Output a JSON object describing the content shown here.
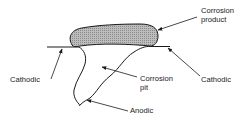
{
  "diagram": {
    "title": "",
    "labels": {
      "corrosion_product": [
        "Corrosion",
        "product"
      ],
      "cathodic_left": "Cathodic",
      "cathodic_right": "Cathodic",
      "corrosion_pit": [
        "Corrosion",
        "pit"
      ],
      "anodic": "Anodic"
    },
    "colors": {
      "line": "#1a1a1a",
      "product_fill": "#a9a9a9",
      "text": "#222222"
    }
  }
}
